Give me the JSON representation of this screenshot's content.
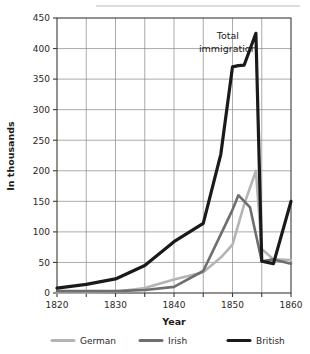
{
  "chart_data": {
    "type": "line",
    "title": "",
    "xlabel": "Year",
    "ylabel": "In thousands",
    "xlim": [
      1820,
      1860
    ],
    "ylim": [
      0,
      450
    ],
    "grid": true,
    "legend_position": "bottom",
    "xticks": [
      1820,
      1830,
      1840,
      1850,
      1860
    ],
    "xtick_labels": [
      "1820",
      "1830",
      "1840",
      "1850",
      "1860"
    ],
    "xminor_ticks": [
      1825,
      1835,
      1845,
      1855
    ],
    "yticks": [
      0,
      50,
      100,
      150,
      200,
      250,
      300,
      350,
      400,
      450
    ],
    "ytick_labels": [
      "0",
      "50",
      "100",
      "150",
      "200",
      "250",
      "300",
      "350",
      "400",
      "450"
    ],
    "annotations": [
      {
        "text_line1": "Total",
        "text_line2": "immigration",
        "x": 1849.2,
        "y": 415
      }
    ],
    "series": [
      {
        "name": "German",
        "color": "#b4b4b4",
        "width": 2.6,
        "x": [
          1820,
          1825,
          1830,
          1835,
          1840,
          1845,
          1848,
          1850,
          1852,
          1854,
          1855,
          1857,
          1860
        ],
        "values": [
          1,
          1,
          2,
          8,
          22,
          34,
          58,
          79,
          145,
          200,
          72,
          55,
          54
        ]
      },
      {
        "name": "Irish",
        "color": "#6e6e6e",
        "width": 2.6,
        "x": [
          1820,
          1825,
          1830,
          1835,
          1840,
          1845,
          1848,
          1850,
          1851,
          1853,
          1855,
          1857,
          1860
        ],
        "values": [
          3,
          3,
          3,
          5,
          10,
          36,
          96,
          136,
          160,
          140,
          52,
          55,
          48
        ]
      },
      {
        "name": "British",
        "color": "#1a1a1a",
        "width": 3.2,
        "x": [
          1820,
          1825,
          1830,
          1835,
          1840,
          1845,
          1848,
          1850,
          1851,
          1852,
          1854,
          1855,
          1857,
          1860
        ],
        "values": [
          8,
          14,
          23,
          45,
          84,
          114,
          227,
          370,
          372,
          373,
          425,
          52,
          48,
          150
        ]
      }
    ]
  },
  "legend": {
    "items": [
      {
        "label": "German",
        "color": "#b4b4b4"
      },
      {
        "label": "Irish",
        "color": "#6e6e6e"
      },
      {
        "label": "British",
        "color": "#1a1a1a"
      }
    ]
  },
  "axis": {
    "x_title": "Year",
    "y_title": "In thousands"
  }
}
